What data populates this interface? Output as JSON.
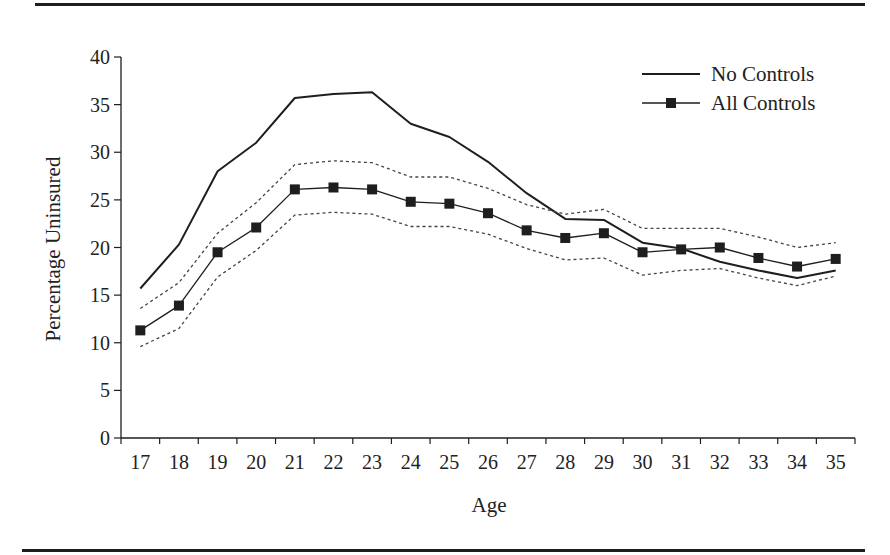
{
  "chart_data": {
    "type": "line",
    "title": "",
    "xlabel": "Age",
    "ylabel": "Percentage Uninsured",
    "ylim": [
      0,
      40
    ],
    "yticks": [
      0,
      5,
      10,
      15,
      20,
      25,
      30,
      35,
      40
    ],
    "grid": false,
    "legend_position": "upper right",
    "categories": [
      "17",
      "18",
      "19",
      "20",
      "21",
      "22",
      "23",
      "24",
      "25",
      "26",
      "27",
      "28",
      "29",
      "30",
      "31",
      "32",
      "33",
      "34",
      "35"
    ],
    "series": [
      {
        "name": "No Controls",
        "style": "solid",
        "marker": "none",
        "values": [
          15.7,
          20.3,
          28.0,
          31.0,
          35.7,
          36.1,
          36.3,
          33.0,
          31.6,
          29.0,
          25.7,
          23.0,
          22.9,
          20.5,
          19.9,
          18.5,
          17.6,
          16.8,
          17.6
        ]
      },
      {
        "name": "All Controls",
        "style": "solid",
        "marker": "square",
        "values": [
          11.3,
          13.9,
          19.5,
          22.1,
          26.1,
          26.3,
          26.1,
          24.8,
          24.6,
          23.6,
          21.8,
          21.0,
          21.5,
          19.5,
          19.8,
          20.0,
          18.9,
          18.0,
          18.8
        ]
      },
      {
        "name": "All Controls Upper Bound",
        "style": "dotted",
        "marker": "none",
        "in_legend": false,
        "values": [
          13.6,
          16.3,
          21.5,
          24.7,
          28.7,
          29.1,
          28.9,
          27.4,
          27.4,
          26.2,
          24.5,
          23.5,
          24.0,
          22.0,
          22.0,
          22.0,
          21.1,
          20.0,
          20.5
        ]
      },
      {
        "name": "All Controls Lower Bound",
        "style": "dotted",
        "marker": "none",
        "in_legend": false,
        "values": [
          9.6,
          11.5,
          16.9,
          19.7,
          23.4,
          23.7,
          23.5,
          22.2,
          22.2,
          21.4,
          19.9,
          18.7,
          18.9,
          17.1,
          17.6,
          17.8,
          16.8,
          16.0,
          17.0
        ]
      }
    ]
  },
  "legend": {
    "items": [
      {
        "label": "No Controls"
      },
      {
        "label": "All Controls"
      }
    ]
  },
  "colors": {
    "line": "#1e1e1e",
    "text": "#222222"
  }
}
